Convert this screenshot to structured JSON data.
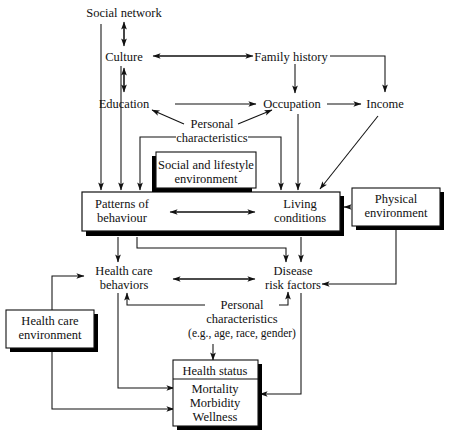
{
  "diagram": {
    "nodes": {
      "social_network": "Social network",
      "culture": "Culture",
      "education": "Education",
      "family_history": "Family history",
      "occupation": "Occupation",
      "income": "Income",
      "personal_characteristics_top_l1": "Personal",
      "personal_characteristics_top_l2": "characteristics",
      "social_lifestyle_l1": "Social and lifestyle",
      "social_lifestyle_l2": "environment",
      "patterns_l1": "Patterns of",
      "patterns_l2": "behaviour",
      "living_l1": "Living",
      "living_l2": "conditions",
      "physical_env_l1": "Physical",
      "physical_env_l2": "environment",
      "health_care_behaviors_l1": "Health care",
      "health_care_behaviors_l2": "behaviors",
      "disease_risk_l1": "Disease",
      "disease_risk_l2": "risk factors",
      "personal_characteristics_bot_l1": "Personal",
      "personal_characteristics_bot_l2": "characteristics",
      "personal_characteristics_bot_l3": "(e.g., age, race, gender)",
      "health_care_env_l1": "Health care",
      "health_care_env_l2": "environment",
      "health_status_header": "Health status",
      "health_status_1": "Mortality",
      "health_status_2": "Morbidity",
      "health_status_3": "Wellness"
    },
    "colors": {
      "line": "#111111",
      "box_fill": "#ffffff",
      "shadow": "#000000",
      "background": "#ffffff"
    }
  }
}
